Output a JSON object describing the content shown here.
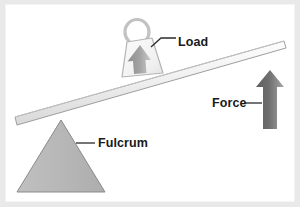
{
  "diagram": {
    "type": "lever-mechanics-diagram",
    "background_color": "#ffffff",
    "frame_color": "#e9e9e9",
    "labels": {
      "load": "Load",
      "force": "Force",
      "fulcrum": "Fulcrum"
    },
    "parts": {
      "beam": {
        "name": "lever-beam",
        "fill": "#f2f2f2",
        "stroke": "#9a9a9a",
        "left_end": "15,122",
        "right_end": "285,44"
      },
      "fulcrum_triangle": {
        "name": "fulcrum-triangle",
        "fill": "#b8b8b8",
        "stroke": "#7d7d7d",
        "apex": "60,120",
        "base_left": "20,192",
        "base_right": "104,192"
      },
      "load_block": {
        "name": "load-weight-block",
        "fill": "#f5f5f5",
        "stroke": "#b0b0b0",
        "shape": "trapezoid",
        "ring_handle": true
      },
      "load_arrow": {
        "name": "load-direction-arrow",
        "direction": "up",
        "fill": "#9b9b9b"
      },
      "force_arrow": {
        "name": "force-direction-arrow",
        "direction": "up",
        "fill": "#6e6e6e",
        "tip": "270,70",
        "base": "270,128"
      },
      "leader_lines": {
        "name": "label-leader-lines",
        "stroke": "#2b2b2b"
      }
    }
  }
}
